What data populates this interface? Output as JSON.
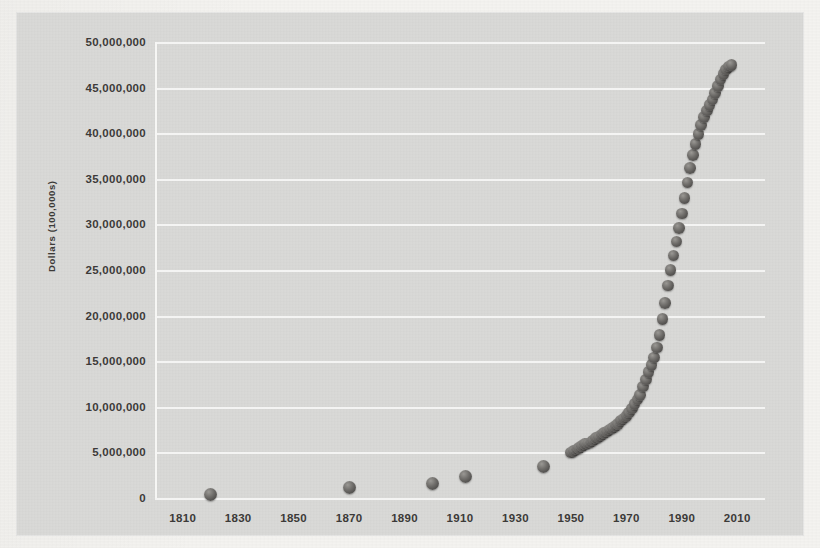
{
  "figure": {
    "y_axis_title": "Dollars (100,000s)",
    "background_color": "#d9d9d7",
    "marker_color": "#55534f",
    "gridline_color": "#f6f6f4"
  },
  "page_ghost_text": [
    "Nearly the U.S. economy into a recession and a credit crisis",
    "ation of the federal debt as a percent of gross domestic",
    "ment of 2.1 and gross domestic product; the problem is not",
    "Why is it important to watch a nation's economy and public",
    "debt as their bailout and spending pile ever higher",
    "bulk of federal spending and more for a given interval",
    "to be more and more debt relative to the whole economy.",
    "levels and also. The figure is more manageable in terms",
    "of debt. The U.S. has continued to borrow, and they might",
    "Figure 3 shows the federal debt by the United States and a",
    "mere number. The debt is about what would be represented in not",
    "a mere problem in isolation. In 1 million, the debt is much",
    "Then the federal debt as a whole would rise, with an",
    "than a flat debt being on the idea that GDP, and not how it"
  ],
  "chart_data": {
    "type": "scatter",
    "title": "",
    "xlabel": "",
    "ylabel": "Dollars (100,000s)",
    "xlim": [
      1800,
      2020
    ],
    "ylim": [
      0,
      50000000
    ],
    "xticks": [
      1810,
      1830,
      1850,
      1870,
      1890,
      1910,
      1930,
      1950,
      1970,
      1990,
      2010
    ],
    "yticks": [
      0,
      5000000,
      10000000,
      15000000,
      20000000,
      25000000,
      30000000,
      35000000,
      40000000,
      45000000,
      50000000
    ],
    "ytick_labels": [
      "0",
      "5,000,000",
      "10,000,000",
      "15,000,000",
      "20,000,000",
      "25,000,000",
      "30,000,000",
      "35,000,000",
      "40,000,000",
      "45,000,000",
      "50,000,000"
    ],
    "grid": true,
    "legend": "none",
    "series": [
      {
        "name": "Federal debt",
        "x": [
          1820,
          1870,
          1900,
          1912,
          1940,
          1950,
          1951,
          1952,
          1953,
          1954,
          1955,
          1956,
          1957,
          1958,
          1959,
          1960,
          1961,
          1962,
          1963,
          1964,
          1965,
          1966,
          1967,
          1968,
          1969,
          1970,
          1971,
          1972,
          1973,
          1974,
          1975,
          1976,
          1977,
          1978,
          1979,
          1980,
          1981,
          1982,
          1983,
          1984,
          1985,
          1986,
          1987,
          1988,
          1989,
          1990,
          1991,
          1992,
          1993,
          1994,
          1995,
          1996,
          1997,
          1998,
          1999,
          2000,
          2001,
          2002,
          2003,
          2004,
          2005,
          2006,
          2007,
          2008
        ],
        "y": [
          400000,
          1100000,
          1600000,
          2400000,
          3500000,
          5000000,
          5150000,
          5300000,
          5500000,
          5700000,
          5900000,
          6000000,
          6100000,
          6300000,
          6600000,
          6700000,
          6900000,
          7100000,
          7300000,
          7500000,
          7700000,
          7900000,
          8100000,
          8500000,
          8700000,
          9000000,
          9400000,
          9800000,
          10300000,
          10800000,
          11300000,
          12200000,
          13000000,
          13800000,
          14600000,
          15400000,
          16500000,
          17900000,
          19600000,
          21400000,
          23300000,
          25000000,
          26600000,
          28100000,
          29600000,
          31200000,
          32900000,
          34600000,
          36200000,
          37600000,
          38800000,
          39900000,
          40900000,
          41800000,
          42500000,
          43100000,
          43700000,
          44400000,
          45200000,
          45900000,
          46500000,
          47000000,
          47300000,
          47500000
        ]
      }
    ]
  }
}
